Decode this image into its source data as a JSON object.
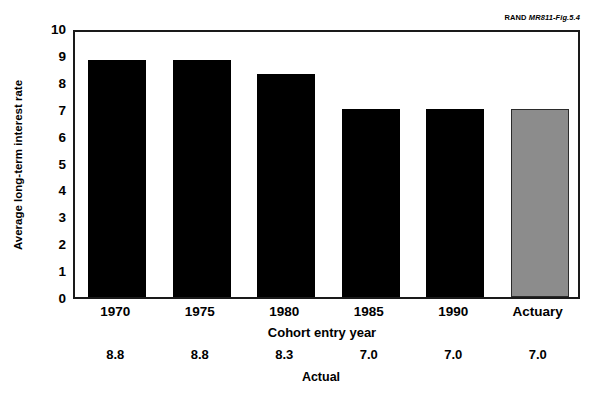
{
  "credit": {
    "publisher": "RAND",
    "figure_id": "MR811-Fig.5.4"
  },
  "chart_data": {
    "type": "bar",
    "title": "",
    "xlabel": "Cohort entry year",
    "ylabel": "Average long-term interest rate",
    "ylim": [
      0,
      10
    ],
    "ytick_step": 1,
    "grid": false,
    "legend": null,
    "categories": [
      "1970",
      "1975",
      "1980",
      "1985",
      "1990",
      "Actuary"
    ],
    "values": [
      8.8,
      8.8,
      8.3,
      7.0,
      7.0,
      7.0
    ],
    "value_labels": [
      "8.8",
      "8.8",
      "8.3",
      "7.0",
      "7.0",
      "7.0"
    ],
    "value_row_label": "Actual",
    "bar_colors": [
      "#000000",
      "#000000",
      "#000000",
      "#000000",
      "#000000",
      "#8c8c8c"
    ],
    "yticks": [
      "10",
      "9",
      "8",
      "7",
      "6",
      "5",
      "4",
      "3",
      "2",
      "1",
      "0"
    ]
  }
}
